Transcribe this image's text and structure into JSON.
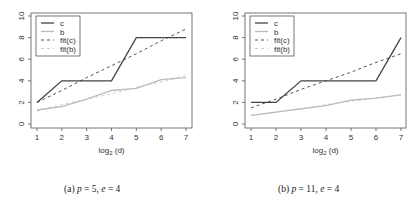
{
  "chart_data": [
    {
      "type": "line",
      "title": "",
      "caption": "(a) p = 5, e = 4",
      "caption_parts": {
        "label": "(a)",
        "p": "5",
        "e": "4"
      },
      "xlabel": "log2 (d)",
      "ylabel": "",
      "x": [
        1,
        2,
        3,
        4,
        5,
        6,
        7
      ],
      "xticks": [
        "1",
        "2",
        "3",
        "4",
        "5",
        "6",
        "7"
      ],
      "yticks": [
        "0",
        "2",
        "4",
        "6",
        "8",
        "10"
      ],
      "xlim": [
        1,
        7
      ],
      "ylim": [
        0,
        10
      ],
      "grid": false,
      "legend_position": "top-left",
      "series": [
        {
          "name": "c",
          "style": "solid",
          "color": "#444444",
          "values": [
            2,
            4,
            4,
            4,
            8,
            8,
            8
          ]
        },
        {
          "name": "b",
          "style": "solid",
          "color": "#bbbbbb",
          "values": [
            1.3,
            1.6,
            2.3,
            3.1,
            3.3,
            4.1,
            4.3
          ]
        },
        {
          "name": "fit(c)",
          "style": "dashed",
          "color": "#555555",
          "values": [
            2.0,
            3.1,
            4.3,
            5.4,
            6.5,
            7.7,
            8.8
          ]
        },
        {
          "name": "fit(b)",
          "style": "dashed",
          "color": "#cccccc",
          "values": [
            1.2,
            1.8,
            2.3,
            2.8,
            3.4,
            3.9,
            4.5
          ]
        }
      ]
    },
    {
      "type": "line",
      "title": "",
      "caption": "(b) p = 11, e = 4",
      "caption_parts": {
        "label": "(b)",
        "p": "11",
        "e": "4"
      },
      "xlabel": "log2 (d)",
      "ylabel": "",
      "x": [
        1,
        2,
        3,
        4,
        5,
        6,
        7
      ],
      "xticks": [
        "1",
        "2",
        "3",
        "4",
        "5",
        "6",
        "7"
      ],
      "yticks": [
        "0",
        "2",
        "4",
        "6",
        "8",
        "10"
      ],
      "xlim": [
        1,
        7
      ],
      "ylim": [
        0,
        10
      ],
      "grid": false,
      "legend_position": "top-left",
      "series": [
        {
          "name": "c",
          "style": "solid",
          "color": "#444444",
          "values": [
            2,
            2,
            4,
            4,
            4,
            4,
            8
          ]
        },
        {
          "name": "b",
          "style": "solid",
          "color": "#bbbbbb",
          "values": [
            0.8,
            1.1,
            1.4,
            1.7,
            2.2,
            2.4,
            2.7
          ]
        },
        {
          "name": "fit(c)",
          "style": "dashed",
          "color": "#555555",
          "values": [
            1.5,
            2.3,
            3.2,
            4.0,
            4.8,
            5.7,
            6.5
          ]
        },
        {
          "name": "fit(b)",
          "style": "dashed",
          "color": "#cccccc",
          "values": [
            0.8,
            1.1,
            1.4,
            1.8,
            2.1,
            2.4,
            2.7
          ]
        }
      ]
    }
  ]
}
